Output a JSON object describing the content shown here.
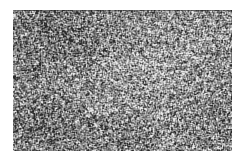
{
  "image": {
    "width": 244,
    "height": 164,
    "background_color": "#ffffff",
    "kind": "grayscale-granular-noise-texture",
    "caption": ""
  },
  "texture_panel": {
    "x": 13,
    "y": 10,
    "width": 219,
    "height": 141,
    "base_color": "#8a8a8a",
    "top_edge_color": "#282828",
    "has_visible_border": false
  },
  "chart_data": {
    "type": "heatmap",
    "title": "",
    "subtitle": "",
    "xlabel": "",
    "ylabel": "",
    "legend": [],
    "annotations": [],
    "grid": false,
    "colormap": "grayscale",
    "value_range": [
      42,
      232
    ],
    "mean_value": 138,
    "std_value": 46,
    "grain": {
      "speckle_size_px": 1,
      "speckle_size_max_px": 3,
      "isotropic": true,
      "smoothing_passes": 1
    },
    "low_frequency_blobs": [
      {
        "cx": 0.18,
        "cy": 0.18,
        "rx": 0.34,
        "ry": 0.36,
        "delta": -26
      },
      {
        "cx": 0.12,
        "cy": 0.82,
        "rx": 0.3,
        "ry": 0.3,
        "delta": -22
      },
      {
        "cx": 0.62,
        "cy": 0.46,
        "rx": 0.44,
        "ry": 0.4,
        "delta": 20
      },
      {
        "cx": 0.88,
        "cy": 0.14,
        "rx": 0.26,
        "ry": 0.26,
        "delta": 12
      },
      {
        "cx": 0.46,
        "cy": 0.92,
        "rx": 0.3,
        "ry": 0.22,
        "delta": -14
      },
      {
        "cx": 0.92,
        "cy": 0.78,
        "rx": 0.24,
        "ry": 0.28,
        "delta": -10
      }
    ],
    "seed": 20240517
  }
}
